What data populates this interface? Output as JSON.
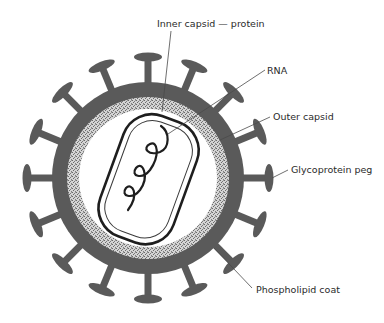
{
  "diagram": {
    "type": "virus-structure",
    "colors": {
      "background": "#ffffff",
      "shell": "#5a5a5a",
      "stipple_light": "#d8d8d8",
      "stipple_dark": "#6a6a6a",
      "interior": "#ffffff",
      "ink": "#1e1e1e",
      "leader": "#4a4a4a"
    },
    "labels": [
      {
        "id": "inner-capsid",
        "text": "Inner capsid — protein",
        "x": 157,
        "y": 27
      },
      {
        "id": "rna",
        "text": "RNA",
        "x": 267,
        "y": 74
      },
      {
        "id": "outer-capsid",
        "text": "Outer capsid",
        "x": 273,
        "y": 120
      },
      {
        "id": "glycoprotein-peg",
        "text": "Glycoprotein peg",
        "x": 291,
        "y": 173
      },
      {
        "id": "phospholipid-coat",
        "text": "Phospholipid coat",
        "x": 256,
        "y": 293
      }
    ],
    "peg_count": 16
  }
}
